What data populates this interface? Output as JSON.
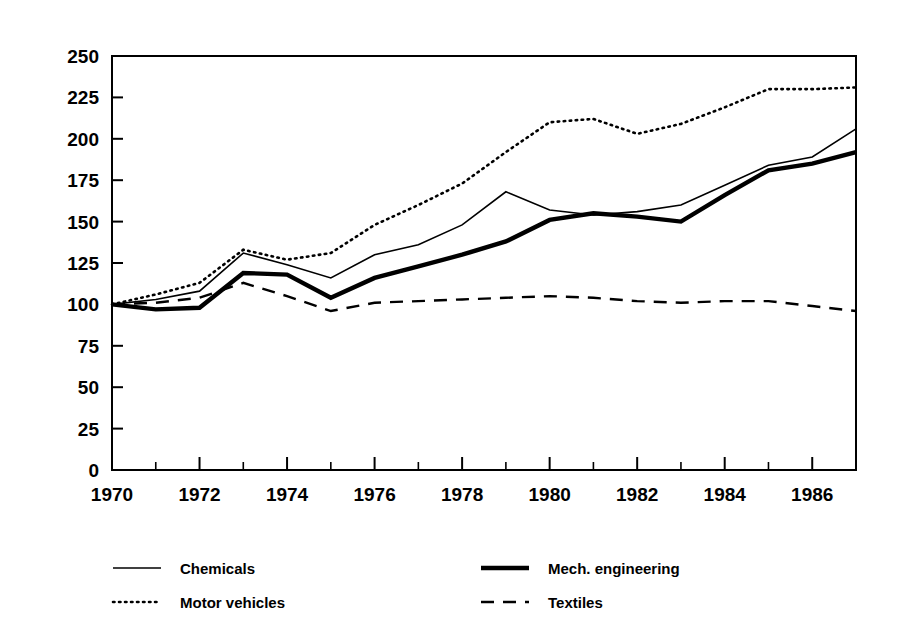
{
  "chart_data": {
    "type": "line",
    "title": "",
    "subtitle": "",
    "xlabel": "",
    "ylabel": "",
    "xlim": [
      1970,
      1987
    ],
    "ylim": [
      0,
      250
    ],
    "grid": false,
    "legend_position": "bottom",
    "x": [
      1970,
      1971,
      1972,
      1973,
      1974,
      1975,
      1976,
      1977,
      1978,
      1979,
      1980,
      1981,
      1982,
      1983,
      1984,
      1985,
      1986,
      1987
    ],
    "xticks_major": [
      1970,
      1972,
      1974,
      1976,
      1978,
      1980,
      1982,
      1984,
      1986
    ],
    "xticklabels": [
      "1970",
      "1972",
      "1974",
      "1976",
      "1978",
      "1980",
      "1982",
      "1984",
      "1986"
    ],
    "xticks_minor": [
      1971,
      1973,
      1975,
      1977,
      1979,
      1981,
      1983,
      1985,
      1987
    ],
    "yticks": [
      0,
      25,
      50,
      75,
      100,
      125,
      150,
      175,
      200,
      225,
      250
    ],
    "yticklabels": [
      "0",
      "25",
      "50",
      "75",
      "100",
      "125",
      "150",
      "175",
      "200",
      "225",
      "250"
    ],
    "series": [
      {
        "name": "Chemicals",
        "style": "solid-thin",
        "color": "#000000",
        "values": [
          100,
          103,
          108,
          131,
          124,
          116,
          130,
          136,
          148,
          168,
          157,
          154,
          156,
          160,
          172,
          184,
          189,
          206
        ]
      },
      {
        "name": "Mech. engineering",
        "style": "solid-thick",
        "color": "#000000",
        "values": [
          100,
          97,
          98,
          119,
          118,
          104,
          116,
          123,
          130,
          138,
          151,
          155,
          153,
          150,
          166,
          181,
          185,
          192
        ]
      },
      {
        "name": "Motor vehicles",
        "style": "dotted",
        "color": "#000000",
        "values": [
          100,
          106,
          113,
          133,
          127,
          131,
          148,
          160,
          173,
          192,
          210,
          212,
          203,
          209,
          219,
          230,
          230,
          231
        ]
      },
      {
        "name": "Textiles",
        "style": "dashed",
        "color": "#000000",
        "values": [
          100,
          101,
          104,
          113,
          105,
          96,
          101,
          102,
          103,
          104,
          105,
          104,
          102,
          101,
          102,
          102,
          99,
          96
        ]
      }
    ]
  },
  "legend": {
    "entries": [
      {
        "label": "Chemicals",
        "style": "solid-thin"
      },
      {
        "label": "Mech. engineering",
        "style": "solid-thick"
      },
      {
        "label": "Motor vehicles",
        "style": "dotted"
      },
      {
        "label": "Textiles",
        "style": "dashed"
      }
    ]
  },
  "axes": {
    "y_labels": [
      "250",
      "225",
      "200",
      "175",
      "150",
      "125",
      "100",
      "75",
      "50",
      "25",
      "0"
    ],
    "x_labels": [
      "1970",
      "1972",
      "1974",
      "1976",
      "1978",
      "1980",
      "1982",
      "1984",
      "1986"
    ]
  }
}
